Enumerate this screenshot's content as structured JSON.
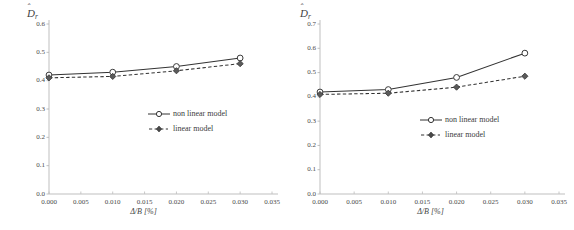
{
  "figure": {
    "panel_count": 2,
    "background": "#ffffff"
  },
  "common": {
    "legend": {
      "entries": [
        {
          "label": "non linear model",
          "marker": "open-circle",
          "line": "solid",
          "color": "#333333"
        },
        {
          "label": "linear model",
          "marker": "filled-diamond",
          "line": "dashed",
          "color": "#333333"
        }
      ]
    },
    "xlabel_main": "Δ/B",
    "xlabel_unit": "[%]",
    "ylabel_base": "D",
    "ylabel_sub": "r",
    "xticks": [
      "0.000",
      "0.005",
      "0.010",
      "0.015",
      "0.020",
      "0.025",
      "0.030",
      "0.035"
    ]
  },
  "left_panel": {
    "yticks": [
      "0.0",
      "0.1",
      "0.2",
      "0.3",
      "0.4",
      "0.5",
      "0.6"
    ],
    "ylabel_base": "D",
    "ylabel_sub": "r",
    "xlabel_main": "Δ/B",
    "xlabel_unit": "[%]",
    "legend_nonlinear": "non linear model",
    "legend_linear": "linear model"
  },
  "right_panel": {
    "yticks": [
      "0.0",
      "0.1",
      "0.2",
      "0.3",
      "0.4",
      "0.5",
      "0.6",
      "0.7"
    ],
    "ylabel_base": "D",
    "ylabel_sub": "r",
    "xlabel_main": "Δ/B",
    "xlabel_unit": "[%]",
    "legend_nonlinear": "non linear model",
    "legend_linear": "linear model"
  },
  "chart_data": [
    {
      "type": "line",
      "panel": "left",
      "title": "",
      "xlabel": "Δ/B [%]",
      "ylabel": "D̂r",
      "xlim": [
        0.0,
        0.035
      ],
      "ylim": [
        0.0,
        0.6
      ],
      "xticks": [
        0.0,
        0.005,
        0.01,
        0.015,
        0.02,
        0.025,
        0.03,
        0.035
      ],
      "yticks": [
        0.0,
        0.1,
        0.2,
        0.3,
        0.4,
        0.5,
        0.6
      ],
      "grid": false,
      "legend_position": "center",
      "x": [
        0.0,
        0.01,
        0.02,
        0.03
      ],
      "series": [
        {
          "name": "non linear model",
          "values": [
            0.42,
            0.43,
            0.45,
            0.48
          ],
          "line": "solid",
          "marker": "open-circle"
        },
        {
          "name": "linear model",
          "values": [
            0.41,
            0.415,
            0.435,
            0.46
          ],
          "line": "dashed",
          "marker": "filled-diamond"
        }
      ]
    },
    {
      "type": "line",
      "panel": "right",
      "title": "",
      "xlabel": "Δ/B [%]",
      "ylabel": "D̂r",
      "xlim": [
        0.0,
        0.035
      ],
      "ylim": [
        0.0,
        0.7
      ],
      "xticks": [
        0.0,
        0.005,
        0.01,
        0.015,
        0.02,
        0.025,
        0.03,
        0.035
      ],
      "yticks": [
        0.0,
        0.1,
        0.2,
        0.3,
        0.4,
        0.5,
        0.6,
        0.7
      ],
      "grid": false,
      "legend_position": "center",
      "x": [
        0.0,
        0.01,
        0.02,
        0.03
      ],
      "series": [
        {
          "name": "non linear model",
          "values": [
            0.42,
            0.43,
            0.48,
            0.58
          ],
          "line": "solid",
          "marker": "open-circle"
        },
        {
          "name": "linear model",
          "values": [
            0.41,
            0.415,
            0.44,
            0.485
          ],
          "line": "dashed",
          "marker": "filled-diamond"
        }
      ]
    }
  ]
}
